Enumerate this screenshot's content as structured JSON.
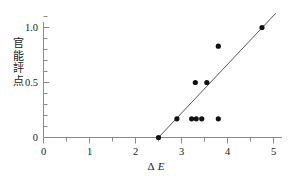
{
  "chart_data": {
    "type": "scatter",
    "title": "",
    "xlabel": "ΔE",
    "xlabel_delta": "Δ",
    "xlabel_e": "E",
    "ylabel": "官能評点",
    "ylabel_chars": [
      "官",
      "能",
      "評",
      "点"
    ],
    "xlim": [
      0,
      5.25
    ],
    "ylim": [
      -0.04,
      1.16
    ],
    "xticks": [
      0,
      1,
      2,
      3,
      4,
      5
    ],
    "xticklabels": [
      "0",
      "1",
      "2",
      "3",
      "4",
      "5"
    ],
    "x_minor_ticks": [
      0.5,
      1.5,
      2.5,
      3.5,
      4.5
    ],
    "yticks": [
      0,
      0.5,
      1.0
    ],
    "yticklabels": [
      "0",
      "0.5",
      "1.0"
    ],
    "y_minor_ticks": [
      0.1,
      0.2,
      0.3,
      0.4,
      0.6,
      0.7,
      0.8,
      0.9,
      1.1
    ],
    "grid": false,
    "legend": "none",
    "marker": "filled-circle",
    "marker_color": "#111111",
    "marker_size_px": 5.2,
    "axis_color": "#8a8a8a",
    "line_color": "#555555",
    "points": [
      {
        "x": 2.5,
        "y": 0.0
      },
      {
        "x": 2.9,
        "y": 0.17
      },
      {
        "x": 3.22,
        "y": 0.17
      },
      {
        "x": 3.32,
        "y": 0.17
      },
      {
        "x": 3.44,
        "y": 0.17
      },
      {
        "x": 3.8,
        "y": 0.17
      },
      {
        "x": 3.3,
        "y": 0.5
      },
      {
        "x": 3.55,
        "y": 0.5
      },
      {
        "x": 3.8,
        "y": 0.83
      },
      {
        "x": 4.75,
        "y": 1.0
      }
    ],
    "fit_line": {
      "type": "linear",
      "x_start": 2.5,
      "y_start": 0.0,
      "x_end": 5.05,
      "y_end": 1.13,
      "x_intercept": 2.5,
      "slope": 0.443
    }
  }
}
